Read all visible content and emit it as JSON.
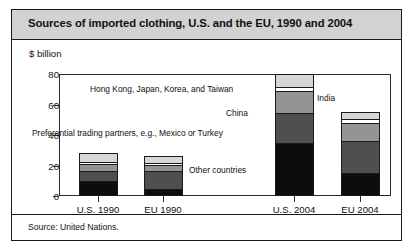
{
  "figure": {
    "title": "Sources of imported clothing, U.S. and the EU, 1990 and 2004",
    "unit_label": "$ billion",
    "source": "Source: United Nations."
  },
  "annotations": {
    "hk_japan_korea_taiwan": "Hong Kong, Japan, Korea, and Taiwan",
    "india": "India",
    "china": "China",
    "preferential": "Preferential trading partners, e.g., Mexico or Turkey",
    "other": "Other countries"
  },
  "colors": {
    "other_countries": "#0d0d0d",
    "preferential": "#4f4f4f",
    "china": "#949494",
    "india": "#ffffff",
    "hk_japan_korea_taiwan": "#d6d6d6",
    "title_bar": "#d2d2d2",
    "border": "#1a1a1a"
  },
  "chart_data": {
    "type": "bar",
    "title": "Sources of imported clothing, U.S. and the EU, 1990 and 2004",
    "xlabel": "",
    "ylabel": "$ billion",
    "ylim": [
      0,
      80
    ],
    "yticks": [
      0,
      20,
      40,
      60,
      80
    ],
    "grid": false,
    "legend": "in-plot annotations",
    "stacked": true,
    "categories": [
      "U.S. 1990",
      "EU 1990",
      "U.S. 2004",
      "EU 2004"
    ],
    "series": [
      {
        "name": "Other countries",
        "values": [
          10,
          4,
          35,
          15
        ]
      },
      {
        "name": "Preferential trading partners, e.g., Mexico or Turkey",
        "values": [
          7,
          13,
          20,
          22
        ]
      },
      {
        "name": "China",
        "values": [
          4,
          4,
          15,
          12
        ]
      },
      {
        "name": "India",
        "values": [
          1,
          1,
          2,
          2
        ]
      },
      {
        "name": "Hong Kong, Japan, Korea, and Taiwan",
        "values": [
          6,
          4,
          8,
          4
        ]
      }
    ],
    "totals": [
      28,
      26,
      80,
      55
    ]
  }
}
